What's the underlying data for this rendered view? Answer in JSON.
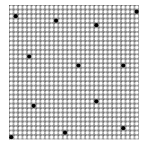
{
  "image": {
    "width": 144,
    "height": 145,
    "background": "#ffffff"
  },
  "grid": {
    "origin_x": 9,
    "origin_y": 5,
    "cols": 29,
    "rows": 30,
    "pitch": 4.48,
    "ring_radius": 1.75,
    "ring_color": "#ffffff",
    "fill_color": "#8c8c8c",
    "dark_color": "#5a5a5a"
  },
  "dots": {
    "color": "#000000",
    "radius": 2.1,
    "items": [
      {
        "col": 1,
        "row": 2
      },
      {
        "col": 10,
        "row": 3
      },
      {
        "col": 19,
        "row": 4
      },
      {
        "col": 28,
        "row": 1
      },
      {
        "col": 4,
        "row": 11
      },
      {
        "col": 15,
        "row": 13
      },
      {
        "col": 25,
        "row": 13
      },
      {
        "col": 5,
        "row": 22
      },
      {
        "col": 19,
        "row": 21
      },
      {
        "col": 12,
        "row": 28
      },
      {
        "col": 25,
        "row": 27
      },
      {
        "col": 0,
        "row": 29
      }
    ]
  }
}
